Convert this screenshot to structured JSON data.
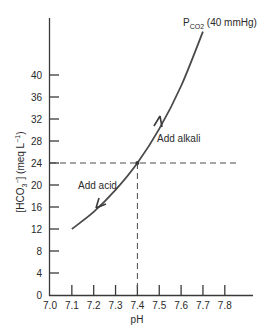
{
  "chart_data": {
    "type": "line",
    "title": "",
    "xlabel": "pH",
    "ylabel": "[HCO3-] (meq L-1)",
    "ylabel_parts": {
      "main": "[HCO",
      "sub": "3",
      "sup": "−",
      "rest": "] (meq L",
      "sup2": "−1",
      "close": ")"
    },
    "xlim": [
      7.0,
      7.9
    ],
    "ylim": [
      0,
      44
    ],
    "x_ticks": [
      "7.0",
      "7.1",
      "7.2",
      "7.3",
      "7.4",
      "7.5",
      "7.6",
      "7.7",
      "7.8"
    ],
    "y_ticks": [
      "0",
      "4",
      "8",
      "12",
      "16",
      "20",
      "24",
      "28",
      "32",
      "36",
      "40"
    ],
    "grid": false,
    "series": [
      {
        "name": "PCO2 (40 mmHg) isobar",
        "x": [
          7.1,
          7.2,
          7.3,
          7.4,
          7.5,
          7.6,
          7.7
        ],
        "y": [
          12.0,
          15.1,
          19.1,
          24.0,
          30.2,
          38.0,
          47.9
        ]
      }
    ],
    "reference_lines": {
      "x": 7.4,
      "y": 24
    },
    "annotations": [
      {
        "text": "Add alkali",
        "direction": "up"
      },
      {
        "text": "Add acid",
        "direction": "down"
      }
    ],
    "curve_label": {
      "main": "P",
      "sub": "CO2",
      "rest": " (40 mmHg)"
    }
  }
}
